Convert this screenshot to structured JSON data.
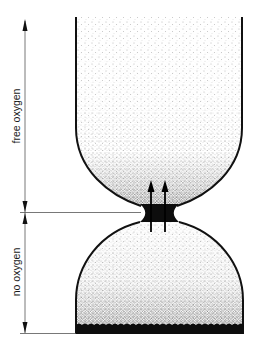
{
  "diagram": {
    "labels": {
      "upper_zone": "free oxygen",
      "lower_zone": "no oxygen"
    },
    "elements": {
      "upper_vessel": "upper chamber (free oxygen)",
      "neck": "constriction / interface",
      "lower_vessel": "lower chamber (no oxygen)",
      "sediment_layer": "dark bottom layer",
      "arrows": "two upward arrows through neck"
    },
    "colors": {
      "ink": "#111111",
      "background": "#ffffff",
      "stipple": "#555555"
    }
  }
}
